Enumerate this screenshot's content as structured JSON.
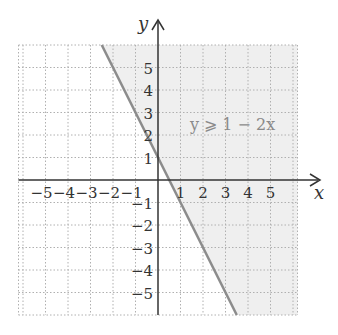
{
  "chart_data": {
    "type": "line",
    "title": "",
    "xlabel": "x",
    "ylabel": "y",
    "xlim": [
      -6,
      6
    ],
    "ylim": [
      -6,
      6
    ],
    "grid": true,
    "x_ticks": [
      -5,
      -4,
      -3,
      -2,
      -1,
      1,
      2,
      3,
      4,
      5
    ],
    "y_ticks": [
      5,
      4,
      3,
      2,
      1,
      -1,
      -2,
      -3,
      -4,
      -5
    ],
    "x_tick_labels": [
      "−5",
      "−4",
      "−3",
      "−2",
      "−1",
      "1",
      "2",
      "3",
      "4",
      "5"
    ],
    "y_tick_labels": [
      "5",
      "4",
      "3",
      "2",
      "1",
      "−1",
      "−2",
      "−3",
      "−4",
      "−5"
    ],
    "boundary_line": {
      "equation": "y = 1 - 2x",
      "slope": -2,
      "intercept": 1
    },
    "shaded_region": "y >= 1 - 2x (right of the line)",
    "annotation": "y ⩾ 1 − 2x",
    "colors": {
      "line": "#8c8c8c",
      "shade": "#efefef",
      "grid": "#b0b0b0",
      "axis": "#333333",
      "annotation": "#8a8a8a"
    }
  }
}
